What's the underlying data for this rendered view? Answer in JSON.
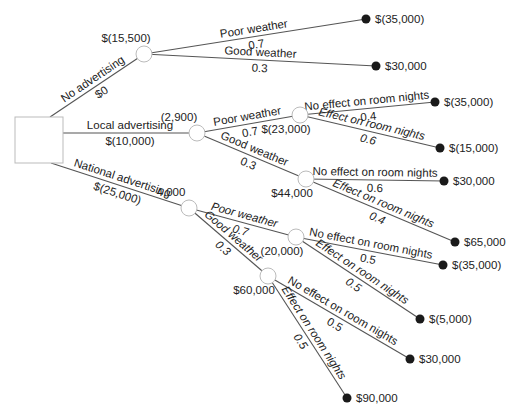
{
  "decision_tree": {
    "decision_node": {
      "x": 15,
      "y": 117,
      "w": 48,
      "h": 46
    },
    "alternatives": [
      {
        "id": "no_adv",
        "label": "No advertising",
        "cost": "$0",
        "ev": "$(15,500)",
        "node": {
          "x": 144,
          "y": 54
        },
        "branches": [
          {
            "label": "Poor weather",
            "prob": "0.7",
            "payoff": "$(35,000)",
            "end": {
              "x": 366,
              "y": 19
            }
          },
          {
            "label": "Good weather",
            "prob": "0.3",
            "payoff": "$30,000",
            "end": {
              "x": 376,
              "y": 66
            }
          }
        ]
      },
      {
        "id": "local_adv",
        "label": "Local advertising",
        "cost": "$(10,000)",
        "ev": "(2,900)",
        "node": {
          "x": 197,
          "y": 133
        },
        "branches": [
          {
            "label": "Poor weather",
            "prob": "0.7",
            "ev": "$(23,000)",
            "node": {
              "x": 300,
              "y": 115
            },
            "outcomes": [
              {
                "label": "No effect on room nights",
                "prob": "0.4",
                "payoff": "$(35,000)",
                "end": {
                  "x": 435,
                  "y": 102
                }
              },
              {
                "label": "Effect on room nights",
                "prob": "0.6",
                "payoff": "$(15,000)",
                "end": {
                  "x": 440,
                  "y": 148
                }
              }
            ]
          },
          {
            "label": "Good weather",
            "prob": "0.3",
            "ev": "$44,000",
            "node": {
              "x": 306,
              "y": 179
            },
            "outcomes": [
              {
                "label": "No effect on room nights",
                "prob": "0.6",
                "payoff": "$30,000",
                "end": {
                  "x": 444,
                  "y": 181
                }
              },
              {
                "label": "Effect on room nights",
                "prob": "0.4",
                "payoff": "$65,000",
                "end": {
                  "x": 455,
                  "y": 242
                }
              }
            ]
          }
        ]
      },
      {
        "id": "national_adv",
        "label": "National advertising",
        "cost": "$(25,000)",
        "ev": "4,000",
        "node": {
          "x": 189,
          "y": 208
        },
        "branches": [
          {
            "label": "Poor weather",
            "prob": "0.7",
            "ev": "(20,000)",
            "node": {
              "x": 296,
              "y": 237
            },
            "outcomes": [
              {
                "label": "No effect on room nights",
                "prob": "0.5",
                "payoff": "$(35,000)",
                "end": {
                  "x": 443,
                  "y": 265
                }
              },
              {
                "label": "Effect on room nights",
                "prob": "0.5",
                "payoff": "$(5,000)",
                "end": {
                  "x": 420,
                  "y": 319
                }
              }
            ]
          },
          {
            "label": "Good weather",
            "prob": "0.3",
            "ev": "$60,000",
            "node": {
              "x": 268,
              "y": 276
            },
            "outcomes": [
              {
                "label": "No effect on room nights",
                "prob": "0.5",
                "payoff": "$30,000",
                "end": {
                  "x": 410,
                  "y": 359
                }
              },
              {
                "label": "Effect on room nights",
                "prob": "0.5",
                "payoff": "$90,000",
                "end": {
                  "x": 347,
                  "y": 398
                }
              }
            ]
          }
        ]
      }
    ]
  }
}
